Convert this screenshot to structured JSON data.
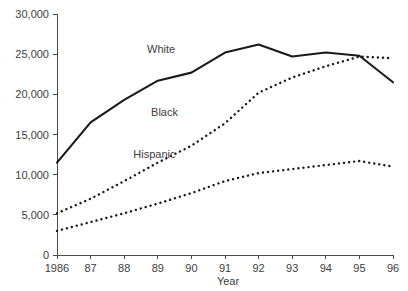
{
  "chart_data": {
    "type": "line",
    "title": "",
    "xlabel": "Year",
    "ylabel": "",
    "x": [
      1986,
      1987,
      1988,
      1989,
      1990,
      1991,
      1992,
      1993,
      1994,
      1995,
      1996
    ],
    "categories": [
      "1986",
      "87",
      "88",
      "89",
      "90",
      "91",
      "92",
      "93",
      "94",
      "95",
      "96"
    ],
    "xlim": [
      1986,
      1996
    ],
    "ylim": [
      0,
      30000
    ],
    "y_ticks": [
      0,
      5000,
      10000,
      15000,
      20000,
      25000,
      30000
    ],
    "y_tick_labels": [
      "0",
      "5,000",
      "10,000",
      "15,000",
      "20,000",
      "25,000",
      "30,000"
    ],
    "grid": false,
    "legend": "inline-annotations",
    "series": [
      {
        "name": "White",
        "style": "solid",
        "values": [
          11500,
          16500,
          19300,
          21700,
          22700,
          25200,
          26200,
          24700,
          25200,
          24800,
          21500
        ]
      },
      {
        "name": "Black",
        "style": "dotted",
        "values": [
          5200,
          7000,
          9200,
          11500,
          13600,
          16400,
          20200,
          22100,
          23500,
          24700,
          24500
        ]
      },
      {
        "name": "Hispanic",
        "style": "dotted",
        "values": [
          3000,
          4100,
          5200,
          6400,
          7700,
          9200,
          10200,
          10700,
          11200,
          11700,
          11000
        ]
      }
    ],
    "annotations": [
      {
        "text": "White",
        "x": 1989.1,
        "y": 25100
      },
      {
        "text": "Black",
        "x": 1989.2,
        "y": 17300
      },
      {
        "text": "Hispanic",
        "x": 1988.9,
        "y": 12100
      }
    ]
  },
  "colors": {
    "background": "#ffffff",
    "line": "#1a1a1a",
    "axis": "#4a4a4a",
    "text": "#3d3d3d"
  }
}
